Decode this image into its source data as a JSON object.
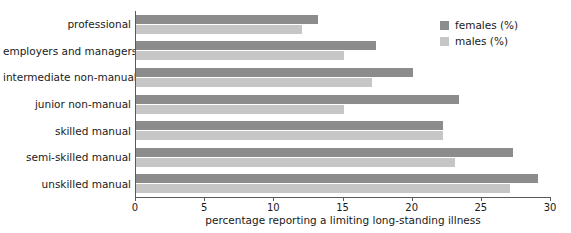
{
  "chart_data": {
    "type": "bar",
    "orientation": "horizontal",
    "title": "",
    "subtitle": "",
    "xlabel": "percentage reporting a limiting long-standing illness",
    "ylabel": "",
    "xlim": [
      0,
      30
    ],
    "xticks": [
      0,
      5,
      10,
      15,
      20,
      25,
      30
    ],
    "xtick_labels": [
      "0",
      "5",
      "10",
      "15",
      "20",
      "25",
      "30"
    ],
    "grid": false,
    "legend_position": "top-right",
    "categories": [
      "professional",
      "employers and managers",
      "intermediate non-manual",
      "junior non-manual",
      "skilled manual",
      "semi-skilled manual",
      "unskilled manual"
    ],
    "series": [
      {
        "name": "females (%)",
        "color": "#8c8c8c",
        "values": [
          13.2,
          17.4,
          20.1,
          23.4,
          22.3,
          27.3,
          29.1
        ]
      },
      {
        "name": "males (%)",
        "color": "#c6c6c6",
        "values": [
          12.1,
          15.1,
          17.1,
          15.1,
          22.3,
          23.1,
          27.1
        ]
      }
    ]
  },
  "legend": {
    "entries": [
      {
        "label": "females (%)",
        "color": "#8c8c8c"
      },
      {
        "label": "males (%)",
        "color": "#c6c6c6"
      }
    ]
  },
  "axis": {
    "x_title": "percentage reporting a limiting long-standing illness"
  }
}
